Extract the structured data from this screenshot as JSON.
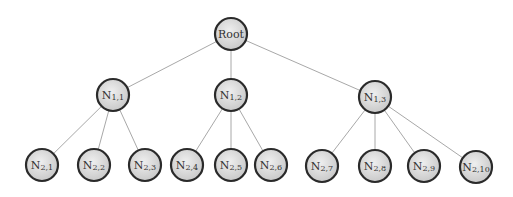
{
  "diagram": {
    "type": "tree",
    "colors": {
      "background": "#ffffff",
      "node_fill_center": "#efefef",
      "node_fill_edge": "#c9c9c9",
      "node_stroke": "#2a2a2a",
      "edge_stroke": "#a8a8a8",
      "label_color": "#333333"
    },
    "node_radius": 16,
    "nodes": [
      {
        "id": "root",
        "label": "Root",
        "sub": "",
        "x": 231,
        "y": 34
      },
      {
        "id": "n1_1",
        "label": "N",
        "sub": "1,1",
        "x": 113,
        "y": 95
      },
      {
        "id": "n1_2",
        "label": "N",
        "sub": "1,2",
        "x": 231,
        "y": 95
      },
      {
        "id": "n1_3",
        "label": "N",
        "sub": "1,3",
        "x": 375,
        "y": 97
      },
      {
        "id": "n2_1",
        "label": "N",
        "sub": "2,1",
        "x": 42,
        "y": 165
      },
      {
        "id": "n2_2",
        "label": "N",
        "sub": "2,2",
        "x": 94,
        "y": 165
      },
      {
        "id": "n2_3",
        "label": "N",
        "sub": "2,3",
        "x": 145,
        "y": 165
      },
      {
        "id": "n2_4",
        "label": "N",
        "sub": "2,4",
        "x": 187,
        "y": 165
      },
      {
        "id": "n2_5",
        "label": "N",
        "sub": "2,5",
        "x": 231,
        "y": 165
      },
      {
        "id": "n2_6",
        "label": "N",
        "sub": "2,6",
        "x": 271,
        "y": 165
      },
      {
        "id": "n2_7",
        "label": "N",
        "sub": "2,7",
        "x": 322,
        "y": 166
      },
      {
        "id": "n2_8",
        "label": "N",
        "sub": "2,8",
        "x": 375,
        "y": 166
      },
      {
        "id": "n2_9",
        "label": "N",
        "sub": "2,9",
        "x": 424,
        "y": 166
      },
      {
        "id": "n2_10",
        "label": "N",
        "sub": "2,10",
        "x": 476,
        "y": 167
      }
    ],
    "edges": [
      [
        "root",
        "n1_1"
      ],
      [
        "root",
        "n1_2"
      ],
      [
        "root",
        "n1_3"
      ],
      [
        "n1_1",
        "n2_1"
      ],
      [
        "n1_1",
        "n2_2"
      ],
      [
        "n1_1",
        "n2_3"
      ],
      [
        "n1_2",
        "n2_4"
      ],
      [
        "n1_2",
        "n2_5"
      ],
      [
        "n1_2",
        "n2_6"
      ],
      [
        "n1_3",
        "n2_7"
      ],
      [
        "n1_3",
        "n2_8"
      ],
      [
        "n1_3",
        "n2_9"
      ],
      [
        "n1_3",
        "n2_10"
      ]
    ]
  }
}
